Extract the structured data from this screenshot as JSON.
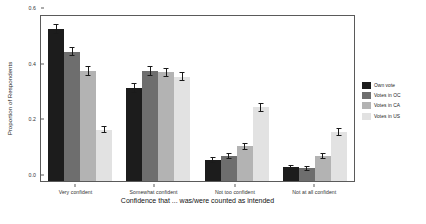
{
  "chart_data": {
    "type": "bar",
    "title": "",
    "subtitle": "",
    "xlabel": "Confidence that ... was/were counted as intended",
    "ylabel": "Proportion of Respondents",
    "categories": [
      "Very confident",
      "Somewhat confident",
      "Not too confident",
      "Not at all confident"
    ],
    "ylim": [
      0.0,
      0.6
    ],
    "yticks": [
      "0.0",
      "0.2",
      "0.4",
      "0.6"
    ],
    "ytick_values": [
      0.0,
      0.2,
      0.4,
      0.6
    ],
    "grid": false,
    "legend_position": "right",
    "errorbars": true,
    "series": [
      {
        "name": "Own vote",
        "color": "#1c1c1c",
        "values": [
          0.545,
          0.335,
          0.075,
          0.05
        ],
        "errors": [
          0.018,
          0.017,
          0.012,
          0.009
        ]
      },
      {
        "name": "Votes in OC",
        "color": "#6e6e6e",
        "values": [
          0.465,
          0.395,
          0.09,
          0.045
        ],
        "errors": [
          0.017,
          0.017,
          0.012,
          0.009
        ]
      },
      {
        "name": "Votes in CA",
        "color": "#b3b3b3",
        "values": [
          0.395,
          0.39,
          0.125,
          0.09
        ],
        "errors": [
          0.018,
          0.017,
          0.013,
          0.012
        ]
      },
      {
        "name": "Votes in US",
        "color": "#e2e2e2",
        "values": [
          0.185,
          0.375,
          0.265,
          0.175
        ],
        "errors": [
          0.014,
          0.017,
          0.016,
          0.014
        ]
      }
    ]
  },
  "figure": {
    "axis_color": "#5a5a5a",
    "background": "#ffffff"
  }
}
